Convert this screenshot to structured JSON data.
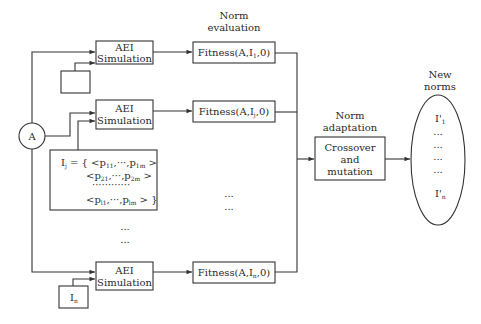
{
  "diagram": {
    "stage_labels": {
      "norm_evaluation": [
        "Norm",
        "evaluation"
      ],
      "norm_adaptation": [
        "Norm",
        "adaptation"
      ],
      "new_norms": [
        "New",
        "norms"
      ]
    },
    "agent_node": {
      "label": "A"
    },
    "simulation_boxes": [
      {
        "line1": "AEI",
        "line2": "Simulation"
      },
      {
        "line1": "AEI",
        "line2": "Simulation"
      },
      {
        "line1": "AEI",
        "line2": "Simulation"
      }
    ],
    "norm_inputs": [
      {
        "label": ""
      },
      {
        "label": "I",
        "sub": "j",
        "set_lines": [
          {
            "prefix": "I",
            "prefix_sub": "j",
            "eq": " = { ",
            "first": "<p",
            "first_sub": "11",
            "mid": ",···,p",
            "last_sub": "1m",
            "close": " >"
          },
          {
            "first": "<p",
            "first_sub": "21",
            "mid": ",···,p",
            "last_sub": "2m",
            "close": " >"
          },
          {
            "dots": "············"
          },
          {
            "first": "<p",
            "first_sub": "l1",
            "mid": ",···,p",
            "last_sub": "lm",
            "close": " > }"
          }
        ]
      },
      {
        "label": "I",
        "sub": "n"
      }
    ],
    "fitness_boxes": [
      {
        "prefix": "Fitness(A,I",
        "sub": "1",
        "suffix": ",0)"
      },
      {
        "prefix": "Fitness(A,I",
        "sub": "j",
        "suffix": ",0)"
      },
      {
        "prefix": "Fitness(A,I",
        "sub": "n",
        "suffix": ",0)"
      }
    ],
    "ellipsis": [
      "...",
      "...",
      "...",
      "..."
    ],
    "crossover_box": [
      "Crossover",
      "and",
      "mutation"
    ],
    "new_norms": {
      "first": {
        "label": "I'",
        "sub": "1"
      },
      "dots": [
        "...",
        "...",
        "...",
        "..."
      ],
      "last": {
        "label": "I'",
        "sub": "n"
      }
    }
  }
}
